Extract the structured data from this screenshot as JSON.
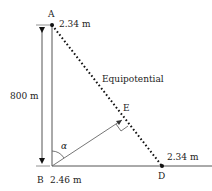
{
  "diagram": {
    "points": {
      "A": {
        "label": "A",
        "value": "2.34 m"
      },
      "B": {
        "label": "B",
        "value": "2.46 m"
      },
      "D": {
        "label": "D",
        "value": "2.34 m"
      },
      "E": {
        "label": "E"
      }
    },
    "height_label": "800 m",
    "angle_label": "α",
    "line_label": "Equipotential",
    "colors": {
      "line": "#555555",
      "dotted": "#111111",
      "text": "#222222"
    }
  }
}
